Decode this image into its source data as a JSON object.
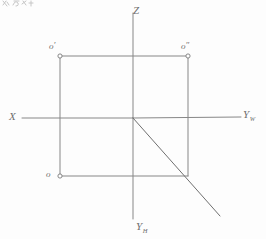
{
  "sheet": {
    "width": 266,
    "height": 239,
    "background_color": "#fdfdfd",
    "ink_color": "#808080",
    "label_color": "#6e6e6e",
    "media": "hand-drawn pencil sketch on white paper"
  },
  "corner_note": {
    "text": "",
    "description": "faint handwritten marks cropped at the top-left edge of the sheet"
  },
  "axes": [
    {
      "id": "z-axis",
      "label": "Z",
      "subscript": "",
      "direction": "up",
      "label_x": 133,
      "label_y": 5,
      "x1": 133,
      "y1": 13,
      "x2": 133,
      "y2": 118
    },
    {
      "id": "x-axis",
      "label": "X",
      "subscript": "",
      "direction": "left",
      "label_x": 9,
      "label_y": 111,
      "x1": 22,
      "y1": 118,
      "x2": 133,
      "y2": 118
    },
    {
      "id": "yw-axis",
      "label": "Y",
      "subscript": "W",
      "direction": "right",
      "label_x": 243,
      "label_y": 109,
      "x1": 133,
      "y1": 118,
      "x2": 241,
      "y2": 117
    },
    {
      "id": "yh-axis",
      "label": "Y",
      "subscript": "H",
      "direction": "down",
      "label_x": 136,
      "label_y": 221,
      "x1": 133,
      "y1": 118,
      "x2": 133,
      "y2": 219
    }
  ],
  "origin": {
    "label": "O",
    "x": 133,
    "y": 118
  },
  "rectangle": {
    "left": 60,
    "top": 56,
    "right": 188,
    "bottom": 176,
    "width": 128,
    "height": 120
  },
  "points": [
    {
      "id": "point-o-front",
      "label": "o",
      "prime": "′",
      "marker": "small-circle",
      "marker_x": 60,
      "marker_y": 56,
      "label_x": 49,
      "label_y": 42,
      "corner": "top-left"
    },
    {
      "id": "point-o-side",
      "label": "o",
      "prime": "″",
      "marker": "small-circle",
      "marker_x": 188,
      "marker_y": 56,
      "label_x": 181,
      "label_y": 42,
      "corner": "top-right"
    },
    {
      "id": "point-o-top",
      "label": "o",
      "prime": "",
      "marker": "small-circle",
      "marker_x": 60,
      "marker_y": 176,
      "label_x": 46,
      "label_y": 170,
      "corner": "bottom-left"
    }
  ],
  "diagonal": {
    "id": "bisector-line",
    "description": "45-degree bisector from origin through the lower-right rectangle corner, extended",
    "x1": 133,
    "y1": 118,
    "x2": 220,
    "y2": 216,
    "passes_through_x": 188,
    "passes_through_y": 176
  }
}
